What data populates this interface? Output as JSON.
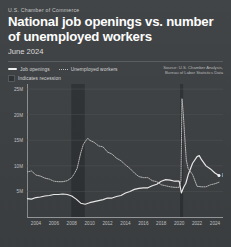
{
  "header": {
    "kicker": "U.S. Chamber of Commerce",
    "title": "National job openings vs. number of unemployed workers",
    "subtitle": "June 2024"
  },
  "legend": {
    "job_openings": "Job openings",
    "unemployed_workers": "Unemployed workers",
    "recession": "Indicates recession"
  },
  "source": {
    "line1": "Source: U.S. Chamber Analysis,",
    "line2": "Bureau of Labor Statistics Data"
  },
  "annotations": {
    "job_openings_end": "8.1M"
  },
  "colors": {
    "background": "#3e4143",
    "card": "#3e4143",
    "title": "#ffffff",
    "job_openings_line": "#f2f2f2",
    "unemployed_line": "#bdbdbd",
    "recession_band": "#2e3133",
    "grid": "#56595b",
    "axis": "#9a9d9f",
    "tick_text": "#c6c8c9"
  },
  "chart_data": {
    "type": "line",
    "title": "National job openings vs. number of unemployed workers",
    "subtitle": "June 2024",
    "xlabel": "",
    "ylabel": "",
    "grid": true,
    "legend_position": "top-left",
    "xlim": [
      2003.0,
      2024.9
    ],
    "ylim": [
      0,
      26000000
    ],
    "ytick_values": [
      5000000,
      10000000,
      15000000,
      20000000,
      25000000
    ],
    "ytick_labels": [
      "5M",
      "10M",
      "15M",
      "20M",
      "25M"
    ],
    "xtick_values": [
      2004,
      2006,
      2008,
      2010,
      2012,
      2014,
      2016,
      2018,
      2020,
      2022,
      2024
    ],
    "xtick_labels": [
      "2004",
      "2006",
      "2008",
      "2010",
      "2012",
      "2014",
      "2016",
      "2018",
      "2020",
      "2022",
      "2024"
    ],
    "recession_bands": [
      {
        "start": 2007.95,
        "end": 2009.45,
        "label": "Indicates recession"
      },
      {
        "start": 2020.1,
        "end": 2020.45,
        "label": "Indicates recession"
      }
    ],
    "series": [
      {
        "name": "Job openings",
        "style": "solid",
        "color": "#f2f2f2",
        "end_label": "8.1M",
        "x": [
          2003.0,
          2003.5,
          2004.0,
          2004.5,
          2005.0,
          2005.5,
          2006.0,
          2006.5,
          2007.0,
          2007.5,
          2008.0,
          2008.5,
          2009.0,
          2009.5,
          2010.0,
          2010.5,
          2011.0,
          2011.5,
          2012.0,
          2012.5,
          2013.0,
          2013.5,
          2014.0,
          2014.5,
          2015.0,
          2015.5,
          2016.0,
          2016.5,
          2017.0,
          2017.5,
          2018.0,
          2018.5,
          2019.0,
          2019.5,
          2020.0,
          2020.25,
          2020.5,
          2020.75,
          2021.0,
          2021.5,
          2022.0,
          2022.25,
          2022.5,
          2023.0,
          2023.5,
          2024.0,
          2024.45
        ],
        "y": [
          3600000,
          3500000,
          3800000,
          3900000,
          4100000,
          4200000,
          4400000,
          4400000,
          4500000,
          4400000,
          4100000,
          3500000,
          2700000,
          2500000,
          2800000,
          3000000,
          3200000,
          3400000,
          3700000,
          3700000,
          4000000,
          4200000,
          4700000,
          5000000,
          5400000,
          5600000,
          5700000,
          5700000,
          6100000,
          6400000,
          7000000,
          7300000,
          7200000,
          7000000,
          7000000,
          4700000,
          5800000,
          6600000,
          8200000,
          10500000,
          11800000,
          12000000,
          11200000,
          10000000,
          9400000,
          8600000,
          8100000
        ]
      },
      {
        "name": "Unemployed workers",
        "style": "dotted",
        "color": "#bdbdbd",
        "x": [
          2003.0,
          2003.5,
          2004.0,
          2004.5,
          2005.0,
          2005.5,
          2006.0,
          2006.5,
          2007.0,
          2007.5,
          2008.0,
          2008.3,
          2008.6,
          2009.0,
          2009.3,
          2009.6,
          2009.8,
          2010.0,
          2010.5,
          2011.0,
          2011.5,
          2012.0,
          2012.5,
          2013.0,
          2013.5,
          2014.0,
          2014.5,
          2015.0,
          2015.5,
          2016.0,
          2016.5,
          2017.0,
          2017.5,
          2018.0,
          2018.5,
          2019.0,
          2019.5,
          2020.0,
          2020.2,
          2020.32,
          2020.45,
          2020.6,
          2020.8,
          2021.0,
          2021.5,
          2022.0,
          2022.5,
          2023.0,
          2023.5,
          2024.0,
          2024.45
        ],
        "y": [
          8800000,
          9000000,
          8200000,
          8000000,
          7600000,
          7400000,
          7000000,
          6900000,
          6900000,
          7100000,
          7700000,
          8500000,
          9500000,
          12500000,
          14200000,
          15000000,
          15400000,
          15000000,
          14600000,
          13900000,
          13700000,
          12700000,
          12300000,
          11500000,
          11000000,
          10200000,
          9500000,
          8600000,
          7900000,
          7700000,
          7700000,
          7100000,
          6900000,
          6300000,
          6100000,
          5900000,
          5800000,
          5800000,
          7100000,
          23100000,
          20500000,
          16300000,
          11100000,
          9500000,
          8300000,
          6000000,
          5900000,
          5900000,
          6300000,
          6500000,
          6800000
        ]
      }
    ]
  }
}
